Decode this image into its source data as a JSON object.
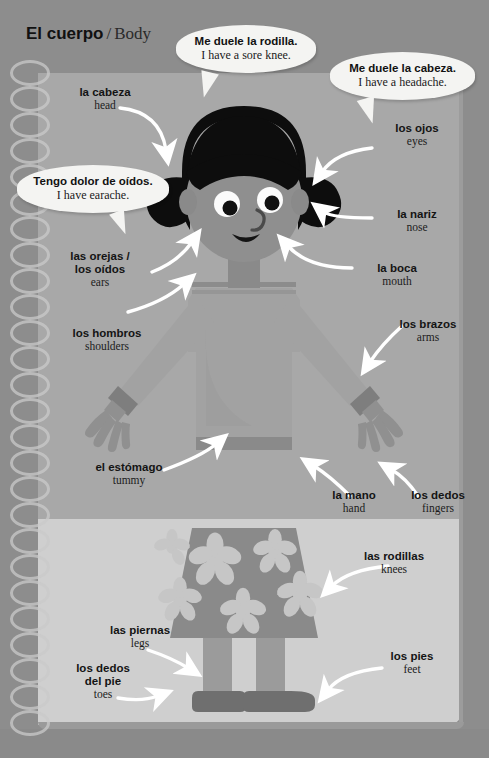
{
  "title": {
    "spanish": "El cuerpo",
    "separator": "/",
    "english": "Body"
  },
  "colors": {
    "page_outer": "#8c8c8c",
    "panel_top": "#a8a8a8",
    "panel_bottom": "#cfcfcf",
    "hair": "#0d0d0d",
    "skin": "#8f8f8f",
    "shirt": "#a0a0a0",
    "shirt_trim": "#7e7e7e",
    "skirt": "#888888",
    "flower": "#bdbdbd",
    "shoe": "#6f6f6f",
    "bubble": "#f4f4f2",
    "arrow": "#ffffff",
    "text": "#141414"
  },
  "bubbles": [
    {
      "id": "knee",
      "spanish": "Me duele la rodilla.",
      "english": "I have a sore knee."
    },
    {
      "id": "headache",
      "spanish": "Me duele la cabeza.",
      "english": "I have a headache."
    },
    {
      "id": "earache",
      "spanish": "Tengo dolor de oídos.",
      "english": "I have earache."
    }
  ],
  "labels": [
    {
      "id": "head",
      "spanish": "la cabeza",
      "english": "head"
    },
    {
      "id": "eyes",
      "spanish": "los ojos",
      "english": "eyes"
    },
    {
      "id": "nose",
      "spanish": "la nariz",
      "english": "nose"
    },
    {
      "id": "mouth",
      "spanish": "la boca",
      "english": "mouth"
    },
    {
      "id": "ears",
      "spanish": "las orejas /\nlos oídos",
      "english": "ears"
    },
    {
      "id": "shoulders",
      "spanish": "los hombros",
      "english": "shoulders"
    },
    {
      "id": "arms",
      "spanish": "los brazos",
      "english": "arms"
    },
    {
      "id": "tummy",
      "spanish": "el estómago",
      "english": "tummy"
    },
    {
      "id": "hand",
      "spanish": "la mano",
      "english": "hand"
    },
    {
      "id": "fingers",
      "spanish": "los dedos",
      "english": "fingers"
    },
    {
      "id": "knees",
      "spanish": "las rodillas",
      "english": "knees"
    },
    {
      "id": "legs",
      "spanish": "las piernas",
      "english": "legs"
    },
    {
      "id": "toes",
      "spanish": "los dedos\ndel pie",
      "english": "toes"
    },
    {
      "id": "feet",
      "spanish": "los pies",
      "english": "feet"
    }
  ],
  "labels_ears_line1": "las orejas /",
  "labels_ears_line2": "los oídos",
  "labels_toes_line1": "los dedos",
  "labels_toes_line2": "del pie"
}
